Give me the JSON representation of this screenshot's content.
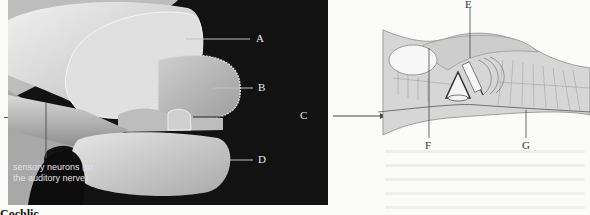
{
  "figure": {
    "photo_labels": {
      "A": "A",
      "B": "B",
      "C": "C",
      "D": "D"
    },
    "sensory_label": "sensory neurons (to the auditory nerve)",
    "diagram_labels": {
      "E": "E",
      "F": "F",
      "G": "G"
    },
    "caption_partial": "Cochlic..."
  },
  "colors": {
    "photo_background": "#121212",
    "tissue_light": "#d9d9d9",
    "diagram_fill": "#d6d6d6",
    "line": "#555555"
  }
}
